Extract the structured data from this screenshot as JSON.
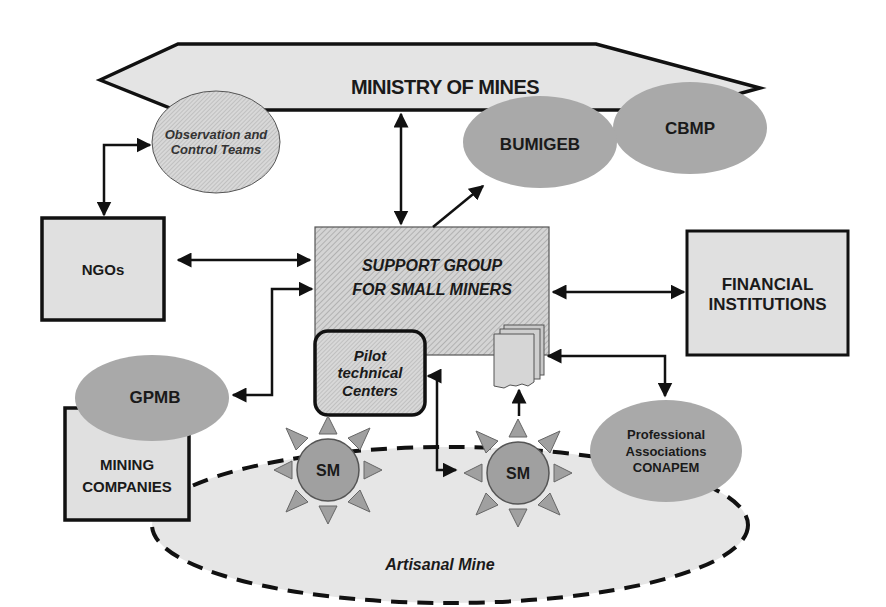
{
  "diagram": {
    "nodes": {
      "ministry": {
        "label": "MINISTRY OF MINES"
      },
      "observation": {
        "label": "Observation and Control Teams"
      },
      "bumigeb": {
        "label": "BUMIGEB"
      },
      "cbmp": {
        "label": "CBMP"
      },
      "ngos": {
        "label": "NGOs"
      },
      "support_group": {
        "label": "SUPPORT GROUP FOR SMALL MINERS",
        "line1": "SUPPORT GROUP",
        "line2": "FOR SMALL MINERS"
      },
      "financial": {
        "label": "FINANCIAL INSTITUTIONS",
        "line1": "FINANCIAL",
        "line2": "INSTITUTIONS"
      },
      "pilot": {
        "label": "Pilot technical Centers",
        "line1": "Pilot",
        "line2": "technical",
        "line3": "Centers"
      },
      "gpmb": {
        "label": "GPMB"
      },
      "mining_companies": {
        "label": "MINING COMPANIES",
        "line1": "MINING",
        "line2": "COMPANIES"
      },
      "sm1": {
        "label": "SM"
      },
      "sm2": {
        "label": "SM"
      },
      "professional": {
        "label": "Professional Associations CONAPEM",
        "line1": "Professional",
        "line2": "Associations",
        "line3": "CONAPEM"
      },
      "artisanal_mine": {
        "label": "Artisanal Mine"
      }
    },
    "edges": [
      {
        "from": "observation",
        "to": "ngos",
        "type": "bidirectional"
      },
      {
        "from": "ministry",
        "to": "support_group",
        "type": "bidirectional"
      },
      {
        "from": "support_group",
        "to": "bumigeb",
        "type": "directed"
      },
      {
        "from": "ngos",
        "to": "support_group",
        "type": "bidirectional"
      },
      {
        "from": "support_group",
        "to": "financial",
        "type": "bidirectional"
      },
      {
        "from": "gpmb",
        "to": "support_group",
        "type": "bidirectional"
      },
      {
        "from": "pilot",
        "to": "sm2",
        "type": "bidirectional"
      },
      {
        "from": "sm2",
        "to": "documents",
        "type": "directed"
      },
      {
        "from": "documents",
        "to": "professional",
        "type": "bidirectional"
      }
    ],
    "colors": {
      "light_fill": "#e2e2e2",
      "medium_fill": "#a9a9a9",
      "sun_fill": "#999999",
      "outline": "#111111",
      "mine_fill": "#e6e6e6"
    }
  }
}
